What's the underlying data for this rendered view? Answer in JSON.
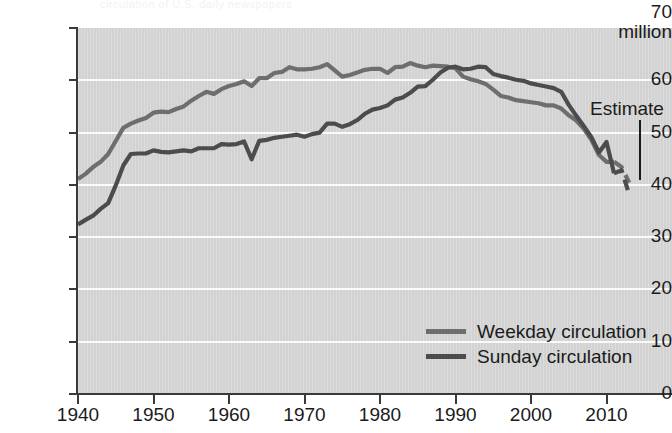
{
  "chart_data": {
    "type": "line",
    "title": "",
    "xlabel": "",
    "ylabel": "million",
    "xlim": [
      1940,
      2014
    ],
    "ylim": [
      0,
      70
    ],
    "ytick_values": [
      0,
      10,
      20,
      30,
      40,
      50,
      60,
      70
    ],
    "xtick_values": [
      1940,
      1950,
      1960,
      1970,
      1980,
      1990,
      2000,
      2010
    ],
    "grid": "horizontal",
    "legend_position": "inside-lower-right",
    "annotations": [
      {
        "text": "Estimate",
        "points_to_x": 2012,
        "points_to_y": 40
      }
    ],
    "series": [
      {
        "name": "Weekday circulation",
        "color": "#6e6e6e",
        "x": [
          1940,
          1941,
          1942,
          1943,
          1944,
          1945,
          1946,
          1947,
          1948,
          1949,
          1950,
          1951,
          1952,
          1953,
          1954,
          1955,
          1956,
          1957,
          1958,
          1959,
          1960,
          1961,
          1962,
          1963,
          1964,
          1965,
          1966,
          1967,
          1968,
          1969,
          1970,
          1971,
          1972,
          1973,
          1974,
          1975,
          1976,
          1977,
          1978,
          1979,
          1980,
          1981,
          1982,
          1983,
          1984,
          1985,
          1986,
          1987,
          1988,
          1989,
          1990,
          1991,
          1992,
          1993,
          1994,
          1995,
          1996,
          1997,
          1998,
          1999,
          2000,
          2001,
          2002,
          2003,
          2004,
          2005,
          2006,
          2007,
          2008,
          2009,
          2010,
          2011,
          2012,
          2013
        ],
        "y": [
          41.1,
          42.1,
          43.4,
          44.4,
          45.9,
          48.4,
          50.9,
          51.7,
          52.3,
          52.8,
          53.8,
          54.0,
          53.9,
          54.5,
          55.0,
          56.1,
          57.0,
          57.8,
          57.4,
          58.3,
          58.9,
          59.3,
          59.8,
          58.9,
          60.4,
          60.4,
          61.4,
          61.6,
          62.5,
          62.1,
          62.1,
          62.2,
          62.5,
          63.1,
          61.9,
          60.7,
          61.0,
          61.5,
          62.0,
          62.2,
          62.2,
          61.4,
          62.5,
          62.6,
          63.3,
          62.8,
          62.5,
          62.8,
          62.7,
          62.6,
          62.3,
          60.7,
          60.2,
          59.8,
          59.3,
          58.2,
          57.0,
          56.7,
          56.2,
          56.0,
          55.8,
          55.6,
          55.2,
          55.2,
          54.6,
          53.3,
          52.3,
          50.7,
          48.6,
          45.7,
          44.4,
          44.4,
          43.4,
          40.4
        ],
        "estimate_from": 2011,
        "estimate_x": [
          2011,
          2012,
          2013
        ],
        "estimate_y": [
          44.4,
          43.4,
          40.4
        ]
      },
      {
        "name": "Sunday circulation",
        "color": "#4c4c4c",
        "x": [
          1940,
          1941,
          1942,
          1943,
          1944,
          1945,
          1946,
          1947,
          1948,
          1949,
          1950,
          1951,
          1952,
          1953,
          1954,
          1955,
          1956,
          1957,
          1958,
          1959,
          1960,
          1961,
          1962,
          1963,
          1964,
          1965,
          1966,
          1967,
          1968,
          1969,
          1970,
          1971,
          1972,
          1973,
          1974,
          1975,
          1976,
          1977,
          1978,
          1979,
          1980,
          1981,
          1982,
          1983,
          1984,
          1985,
          1986,
          1987,
          1988,
          1989,
          1990,
          1991,
          1992,
          1993,
          1994,
          1995,
          1996,
          1997,
          1998,
          1999,
          2000,
          2001,
          2002,
          2003,
          2004,
          2005,
          2006,
          2007,
          2008,
          2009,
          2010,
          2011,
          2012,
          2013
        ],
        "y": [
          32.4,
          33.3,
          34.1,
          35.4,
          36.5,
          39.9,
          43.7,
          45.9,
          46.0,
          46.0,
          46.6,
          46.3,
          46.2,
          46.4,
          46.6,
          46.4,
          47.0,
          47.0,
          47.0,
          47.8,
          47.7,
          47.8,
          48.3,
          44.9,
          48.4,
          48.6,
          49.0,
          49.2,
          49.4,
          49.6,
          49.2,
          49.7,
          50.0,
          51.7,
          51.7,
          51.1,
          51.6,
          52.4,
          53.6,
          54.4,
          54.7,
          55.2,
          56.3,
          56.7,
          57.6,
          58.8,
          58.9,
          60.1,
          61.5,
          62.4,
          62.6,
          62.1,
          62.2,
          62.6,
          62.5,
          61.2,
          60.8,
          60.5,
          60.1,
          59.9,
          59.4,
          59.1,
          58.8,
          58.5,
          57.8,
          55.3,
          53.2,
          51.2,
          49.1,
          46.2,
          48.2,
          42.2,
          42.8,
          38.2
        ],
        "estimate_from": 2011,
        "estimate_x": [
          2011,
          2012,
          2013
        ],
        "estimate_y": [
          42.2,
          42.8,
          38.2
        ]
      }
    ]
  },
  "axis": {
    "y_top_label": "70",
    "y_unit_label": "million",
    "y_labels": [
      "60",
      "50",
      "40",
      "30",
      "20",
      "10",
      "0"
    ],
    "x_labels": [
      "1940",
      "1950",
      "1960",
      "1970",
      "1980",
      "1990",
      "2000",
      "2010"
    ]
  },
  "legend": {
    "items": [
      {
        "label": "Weekday circulation",
        "color": "#6e6e6e"
      },
      {
        "label": "Sunday circulation",
        "color": "#4c4c4c"
      }
    ]
  },
  "annotation": {
    "estimate_label": "Estimate"
  },
  "ghost": {
    "cut_title": "circulation of U.S. daily newspapers"
  }
}
